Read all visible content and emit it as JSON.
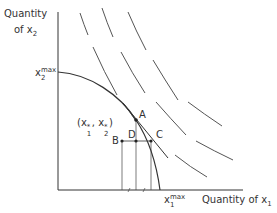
{
  "axes": {
    "y_label_line1": "Quantity",
    "y_label_line2_prefix": "of x",
    "y_label_line2_sub": "2",
    "x_label_prefix": "Quantity of x",
    "x_label_sub": "1"
  },
  "intercepts": {
    "x2max_base": "x",
    "x2max_sub": "2",
    "x2max_sup": "max",
    "x1max_base": "x",
    "x1max_sub": "1",
    "x1max_sup": "max"
  },
  "optimum_label": {
    "open": "(x",
    "sub1": "1",
    "star1": "*",
    "mid": ", x",
    "sub2": "2",
    "star2": "*",
    "close": ")"
  },
  "points": {
    "A": "A",
    "B": "B",
    "C": "C",
    "D": "D"
  },
  "colors": {
    "line": "#333333",
    "dashed": "#555555"
  }
}
